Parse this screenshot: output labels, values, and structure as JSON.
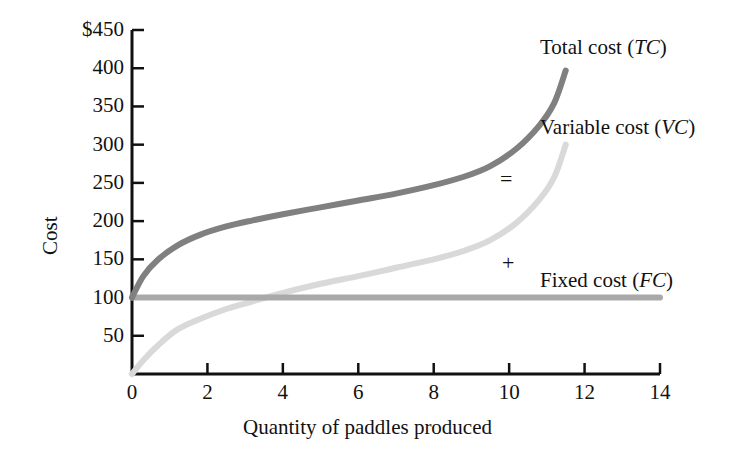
{
  "chart_data": {
    "type": "line",
    "title": "",
    "subtitle": "",
    "xlabel": "Quantity of paddles produced",
    "ylabel": "Cost",
    "xlim": [
      0,
      14
    ],
    "ylim": [
      0,
      450
    ],
    "xticks": [
      "0",
      "2",
      "4",
      "6",
      "8",
      "10",
      "12",
      "14"
    ],
    "xtick_values": [
      0,
      2,
      4,
      6,
      8,
      10,
      12,
      14
    ],
    "yticks": [
      "$450",
      "400",
      "350",
      "300",
      "250",
      "200",
      "150",
      "100",
      "50"
    ],
    "ytick_values": [
      450,
      400,
      350,
      300,
      250,
      200,
      150,
      100,
      50
    ],
    "grid": false,
    "legend_position": "inline-right",
    "annotations": [
      {
        "text": "=",
        "x": 10.0,
        "y": 252,
        "name": "equals-operator"
      },
      {
        "text": "+",
        "x": 10.0,
        "y": 148,
        "name": "plus-operator"
      }
    ],
    "series": [
      {
        "name": "Total cost",
        "abbr": "TC",
        "label": "Total cost (TC)",
        "color": "#808080",
        "width": 6,
        "x": [
          0,
          0.3,
          0.7,
          1.2,
          1.8,
          2.5,
          3.2,
          4.0,
          5.0,
          6.0,
          7.0,
          8.0,
          8.8,
          9.5,
          10.2,
          10.8,
          11.2,
          11.5
        ],
        "values": [
          100,
          128,
          150,
          168,
          182,
          193,
          201,
          209,
          218,
          227,
          236,
          247,
          258,
          272,
          295,
          325,
          355,
          397
        ]
      },
      {
        "name": "Variable cost",
        "abbr": "VC",
        "label": "Variable cost (VC)",
        "color": "#d9d9d9",
        "width": 6,
        "x": [
          0,
          0.3,
          0.7,
          1.2,
          1.8,
          2.5,
          3.2,
          4.0,
          5.0,
          6.0,
          7.0,
          8.0,
          8.8,
          9.5,
          10.2,
          10.8,
          11.2,
          11.5
        ],
        "values": [
          0,
          18,
          38,
          58,
          72,
          85,
          95,
          106,
          118,
          128,
          139,
          150,
          161,
          175,
          198,
          228,
          258,
          300
        ]
      },
      {
        "name": "Fixed cost",
        "abbr": "FC",
        "label": "Fixed cost (FC)",
        "color": "#a9a9a9",
        "width": 6,
        "x": [
          0,
          14
        ],
        "values": [
          100,
          100
        ]
      }
    ]
  },
  "labels": {
    "total_cost_prefix": "Total cost (",
    "total_cost_abbr": "TC",
    "variable_cost_prefix": "Variable cost (",
    "variable_cost_abbr": "VC",
    "fixed_cost_prefix": "Fixed cost (",
    "fixed_cost_abbr": "FC",
    "paren_close": ")",
    "equals": "=",
    "plus": "+"
  },
  "colors": {
    "total_cost": "#808080",
    "variable_cost": "#d9d9d9",
    "fixed_cost": "#a9a9a9",
    "axis": "#111111",
    "background": "#ffffff"
  }
}
